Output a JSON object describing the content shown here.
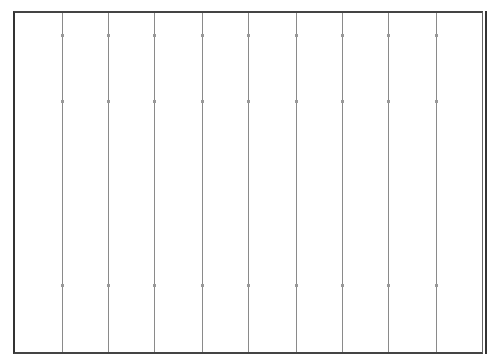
{
  "grid": {
    "columns": 10,
    "divider_x": [
      62,
      108,
      154,
      202,
      248,
      296,
      342,
      388,
      436
    ],
    "frame": {
      "left": 13,
      "top": 11,
      "right": 487,
      "bottom": 354
    },
    "border_color": "#333333",
    "divider_color": "#8a8a8a",
    "background": "#ffffff"
  }
}
